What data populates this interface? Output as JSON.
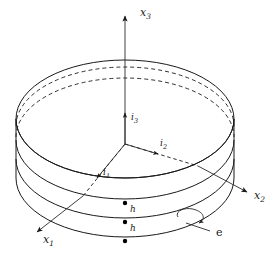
{
  "figure": {
    "background_color": "#ffffff",
    "line_color": "#1a1a1a"
  },
  "axes": [
    {
      "name": "x3",
      "label": "x",
      "subscript": "3",
      "direction": "up",
      "style": "solid",
      "label_x": 140,
      "label_y": 16
    },
    {
      "name": "x2",
      "label": "x",
      "subscript": "2",
      "direction": "lower-right",
      "style": "dashed-inside-solid-outside",
      "label_x": 254,
      "label_y": 199
    },
    {
      "name": "x1",
      "label": "x",
      "subscript": "1",
      "direction": "lower-left",
      "style": "dashed-inside-solid-outside",
      "label_x": 43,
      "label_y": 243
    }
  ],
  "basis_vectors": [
    {
      "name": "i3",
      "label": "i",
      "subscript": "3",
      "direction": "up",
      "label_x": 131,
      "label_y": 120
    },
    {
      "name": "i2",
      "label": "i",
      "subscript": "2",
      "direction": "right",
      "label_x": 160,
      "label_y": 146
    },
    {
      "name": "i1",
      "label": "i",
      "subscript": "1",
      "direction": "lower-left",
      "label_x": 103,
      "label_y": 175
    }
  ],
  "annotations": [
    {
      "name": "thickness-upper",
      "label": "h",
      "x": 130,
      "y": 212
    },
    {
      "name": "thickness-lower",
      "label": "h",
      "x": 130,
      "y": 231
    },
    {
      "name": "edge-curve",
      "label": "e",
      "x": 216,
      "y": 232
    }
  ],
  "markers": [
    {
      "name": "node-top",
      "x": 125,
      "y": 203
    },
    {
      "name": "node-mid",
      "x": 125,
      "y": 222
    },
    {
      "name": "node-bottom",
      "x": 125,
      "y": 241
    }
  ],
  "colors": {
    "ink": "#1a1a1a",
    "paper": "#ffffff",
    "marker": "#000000"
  }
}
